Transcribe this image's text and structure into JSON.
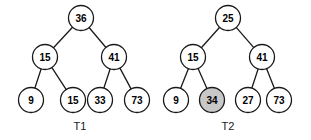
{
  "figure": {
    "width": 311,
    "height": 140,
    "background": "#ffffff",
    "stroke_color": "#1a1a1a",
    "node_fill_default": "#ffffff",
    "node_fill_highlight": "#c8c8c8",
    "node_radius": 12.5,
    "caption_color": "#1a1a1a"
  },
  "trees": [
    {
      "id": "T1",
      "caption": "T1",
      "caption_pos": {
        "x": 80,
        "y": 126
      },
      "nodes": [
        {
          "id": "t1-root",
          "label": "36",
          "x": 81,
          "y": 18,
          "highlight": false
        },
        {
          "id": "t1-l",
          "label": "15",
          "x": 45,
          "y": 57,
          "highlight": false
        },
        {
          "id": "t1-r",
          "label": "41",
          "x": 114,
          "y": 57,
          "highlight": false
        },
        {
          "id": "t1-ll",
          "label": "9",
          "x": 31,
          "y": 100,
          "highlight": false
        },
        {
          "id": "t1-lr",
          "label": "15",
          "x": 73,
          "y": 100,
          "highlight": false
        },
        {
          "id": "t1-rl",
          "label": "33",
          "x": 100,
          "y": 100,
          "highlight": false
        },
        {
          "id": "t1-rr",
          "label": "73",
          "x": 137,
          "y": 100,
          "highlight": false
        }
      ],
      "edges": [
        {
          "from": "t1-root",
          "to": "t1-l"
        },
        {
          "from": "t1-root",
          "to": "t1-r"
        },
        {
          "from": "t1-l",
          "to": "t1-ll"
        },
        {
          "from": "t1-l",
          "to": "t1-lr"
        },
        {
          "from": "t1-r",
          "to": "t1-rl"
        },
        {
          "from": "t1-r",
          "to": "t1-rr"
        }
      ]
    },
    {
      "id": "T2",
      "caption": "T2",
      "caption_pos": {
        "x": 228,
        "y": 126
      },
      "nodes": [
        {
          "id": "t2-root",
          "label": "25",
          "x": 228,
          "y": 18,
          "highlight": false
        },
        {
          "id": "t2-l",
          "label": "15",
          "x": 193,
          "y": 57,
          "highlight": false
        },
        {
          "id": "t2-r",
          "label": "41",
          "x": 262,
          "y": 57,
          "highlight": false
        },
        {
          "id": "t2-ll",
          "label": "9",
          "x": 176,
          "y": 100,
          "highlight": false
        },
        {
          "id": "t2-lr",
          "label": "34",
          "x": 212,
          "y": 100,
          "highlight": true
        },
        {
          "id": "t2-rl",
          "label": "27",
          "x": 248,
          "y": 100,
          "highlight": false
        },
        {
          "id": "t2-rr",
          "label": "73",
          "x": 279,
          "y": 100,
          "highlight": false
        }
      ],
      "edges": [
        {
          "from": "t2-root",
          "to": "t2-l"
        },
        {
          "from": "t2-root",
          "to": "t2-r"
        },
        {
          "from": "t2-l",
          "to": "t2-ll"
        },
        {
          "from": "t2-l",
          "to": "t2-lr"
        },
        {
          "from": "t2-r",
          "to": "t2-rl"
        },
        {
          "from": "t2-r",
          "to": "t2-rr"
        }
      ]
    }
  ]
}
